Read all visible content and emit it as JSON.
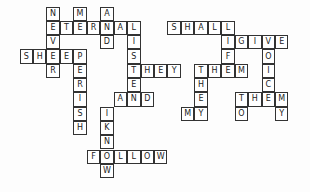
{
  "puzzle": {
    "type": "crossword",
    "grid": {
      "origin_x": 20,
      "origin_y": 7,
      "cell_w": 13.45,
      "cell_h": 14.3
    },
    "words": [
      {
        "word": "NEVER",
        "dir": "down",
        "col": 2,
        "row": 0
      },
      {
        "word": "ME",
        "dir": "down",
        "col": 4,
        "row": 0
      },
      {
        "word": "AND",
        "dir": "down",
        "col": 6,
        "row": 0
      },
      {
        "word": "ETERNAL",
        "dir": "across",
        "col": 2,
        "row": 1
      },
      {
        "word": "LISTEN",
        "dir": "down",
        "col": 8,
        "row": 1
      },
      {
        "word": "SHEEP",
        "dir": "across",
        "col": 0,
        "row": 3
      },
      {
        "word": "PERISH",
        "dir": "down",
        "col": 4,
        "row": 3
      },
      {
        "word": "THEY",
        "dir": "across",
        "col": 8,
        "row": 4
      },
      {
        "word": "AND",
        "dir": "across",
        "col": 7,
        "row": 6
      },
      {
        "word": "IKNOW",
        "dir": "down",
        "col": 6,
        "row": 7
      },
      {
        "word": "FOLLOW",
        "dir": "across",
        "col": 5,
        "row": 10
      },
      {
        "word": "SHALL",
        "dir": "across",
        "col": 11,
        "row": 1
      },
      {
        "word": "LIF",
        "dir": "down",
        "col": 15,
        "row": 1
      },
      {
        "word": "IGIVE",
        "dir": "across",
        "col": 15,
        "row": 2
      },
      {
        "word": "VOICE",
        "dir": "down",
        "col": 18,
        "row": 2
      },
      {
        "word": "THEM",
        "dir": "across",
        "col": 13,
        "row": 4
      },
      {
        "word": "THEY",
        "dir": "down",
        "col": 13,
        "row": 4
      },
      {
        "word": "MY",
        "dir": "across",
        "col": 12,
        "row": 7
      },
      {
        "word": "THEM",
        "dir": "across",
        "col": 16,
        "row": 6
      },
      {
        "word": "TO",
        "dir": "down",
        "col": 16,
        "row": 6
      },
      {
        "word": "MY",
        "dir": "down",
        "col": 19,
        "row": 6
      }
    ]
  }
}
